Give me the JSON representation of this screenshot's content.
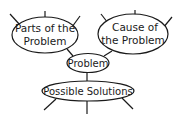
{
  "diagram": {
    "type": "concept-map",
    "nodes": {
      "parts": {
        "line1": "Parts of the",
        "line2": "Problem"
      },
      "cause": {
        "line1": "Cause of",
        "line2": "the Problem"
      },
      "problem": {
        "label": "Problem"
      },
      "solutions": {
        "label": "Possible Solutions"
      }
    },
    "colors": {
      "stroke": "#1a1a1a",
      "fill": "#ffffff"
    }
  }
}
